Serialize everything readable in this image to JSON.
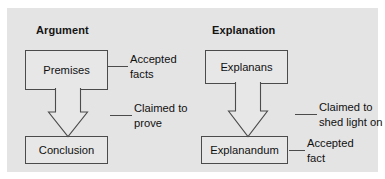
{
  "figure": {
    "panel_bg": "#e4e4e4",
    "node_fill": "#e7e7e7",
    "stroke": "#4b4b4b",
    "text_color": "#101010"
  },
  "columns": [
    {
      "title": "Argument",
      "source_node": "Premises",
      "target_node": "Conclusion",
      "source_annotation": "Accepted\nfacts",
      "relation_annotation": "Claimed to\nprove"
    },
    {
      "title": "Explanation",
      "source_node": "Explanans",
      "target_node": "Explanandum",
      "relation_annotation": "Claimed to\nshed light on",
      "target_annotation": "Accepted\nfact"
    }
  ],
  "labels": {
    "title_argument": "Argument",
    "title_explanation": "Explanation",
    "node_premises": "Premises",
    "node_conclusion": "Conclusion",
    "node_explanans": "Explanans",
    "node_explanandum": "Explanandum",
    "anno_accepted_facts_line1": "Accepted",
    "anno_accepted_facts_line2": "facts",
    "anno_claimed_prove_line1": "Claimed to",
    "anno_claimed_prove_line2": "prove",
    "anno_shed_light_line1": "Claimed to",
    "anno_shed_light_line2": "shed light on",
    "anno_accepted_fact_line1": "Accepted",
    "anno_accepted_fact_line2": "fact"
  },
  "icons": {
    "argument_arrow": "block-arrow-down-icon",
    "explanation_arrow": "block-arrow-down-icon"
  }
}
